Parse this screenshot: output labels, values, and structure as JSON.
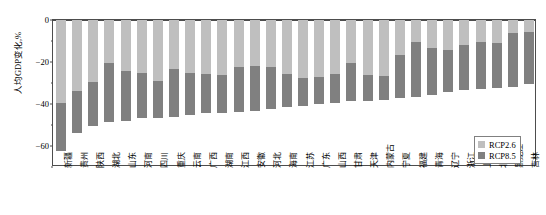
{
  "chart_data": {
    "type": "bar",
    "title": "",
    "subtitle": "",
    "xlabel": "",
    "ylabel": "人均GDP变化,%",
    "ylim": [
      -70,
      0
    ],
    "yticks": [
      0,
      -20,
      -40,
      -60
    ],
    "ytick_labels": [
      "0",
      "−20",
      "−40",
      "−60"
    ],
    "grid": false,
    "legend_position": "bottom-right",
    "bar_style": "overlaid",
    "note": "Each province shows two overlaid negative bars: the light bar is RCP2.6 (smaller magnitude) drawn behind, the dark bar is RCP8.5 (larger magnitude) drawn in front from the zero axis downward.",
    "categories": [
      "新疆",
      "贵州",
      "陕西",
      "湖北",
      "山东",
      "河南",
      "四川",
      "重庆",
      "云南",
      "广西",
      "湖南",
      "江西",
      "安徽",
      "河北",
      "海南",
      "江苏",
      "广东",
      "山西",
      "甘肃",
      "天津",
      "内蒙古",
      "宁夏",
      "福建",
      "青海",
      "辽宁",
      "浙江",
      "上海",
      "北京",
      "黑龙江",
      "吉林"
    ],
    "series": [
      {
        "name": "RCP2.6",
        "color": "#bfbfbf",
        "values": [
          -39.5,
          -34.0,
          -29.5,
          -20.5,
          -24.5,
          -25.0,
          -29.0,
          -23.5,
          -25.0,
          -25.5,
          -26.0,
          -22.5,
          -22.0,
          -22.5,
          -25.5,
          -27.5,
          -27.0,
          -25.5,
          -20.5,
          -26.0,
          -26.5,
          -16.5,
          -10.5,
          -13.5,
          -14.5,
          -12.0,
          -10.5,
          -11.0,
          -6.0,
          -5.5
        ]
      },
      {
        "name": "RCP8.5",
        "color": "#808080",
        "values": [
          -62.5,
          -54.0,
          -50.5,
          -48.5,
          -48.0,
          -46.5,
          -46.5,
          -46.0,
          -45.0,
          -44.5,
          -44.5,
          -44.0,
          -43.5,
          -42.5,
          -41.5,
          -41.0,
          -40.0,
          -39.5,
          -38.5,
          -38.5,
          -38.0,
          -37.0,
          -36.5,
          -35.5,
          -34.5,
          -33.5,
          -33.0,
          -32.5,
          -32.0,
          -30.5
        ]
      }
    ]
  },
  "legend": {
    "items": [
      {
        "label": "RCP2.6",
        "color": "#bfbfbf"
      },
      {
        "label": "RCP8.5",
        "color": "#808080"
      }
    ]
  },
  "axes": {
    "y_title": "人均GDP变化,%"
  }
}
